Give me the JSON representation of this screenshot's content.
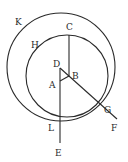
{
  "diagram": {
    "type": "geometric-construction",
    "stroke_color": "#2a2a2a",
    "circles": [
      {
        "name": "K",
        "cx": 61,
        "cy": 67,
        "r": 54
      },
      {
        "name": "H",
        "cx": 67,
        "cy": 76,
        "r": 41
      }
    ],
    "points": {
      "A": {
        "label": "A",
        "x": 60,
        "y": 81
      },
      "B": {
        "label": "B",
        "x": 69,
        "y": 76
      },
      "C": {
        "label": "C",
        "x": 69,
        "y": 35
      },
      "D": {
        "label": "D",
        "x": 60,
        "y": 68
      },
      "E": {
        "label": "E",
        "x": 60,
        "y": 143
      },
      "F": {
        "label": "F",
        "x": 117,
        "y": 119
      },
      "G": {
        "label": "G",
        "x": 99,
        "y": 107
      },
      "H": {
        "label": "H"
      },
      "K": {
        "label": "K"
      },
      "L": {
        "label": "L"
      }
    },
    "segments": [
      {
        "name": "CB",
        "from": "C",
        "to": "B"
      },
      {
        "name": "DE",
        "from": "D",
        "to": "E"
      },
      {
        "name": "DF",
        "from": "D",
        "to": "F"
      },
      {
        "name": "AB",
        "from": "A",
        "to": "B"
      }
    ]
  }
}
